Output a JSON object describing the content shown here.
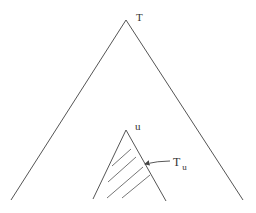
{
  "diagram": {
    "type": "tree-subtree",
    "big_triangle": {
      "label": "T",
      "apex": [
        126,
        20
      ],
      "base_left": [
        11,
        200
      ],
      "base_right": [
        243,
        200
      ]
    },
    "small_triangle": {
      "label": "u",
      "apex": [
        126,
        130
      ],
      "base_left": [
        93,
        199
      ],
      "base_right": [
        166,
        201
      ],
      "hatched": true
    },
    "subtree_label": {
      "main": "T",
      "subscript": "u",
      "arrow_to": "small-triangle-right-edge"
    },
    "colors": {
      "stroke": "#555555",
      "text": "#333333",
      "background": "#ffffff"
    }
  }
}
